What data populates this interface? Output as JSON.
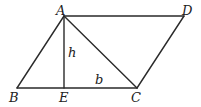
{
  "diagram": {
    "type": "geometry-parallelogram",
    "colors": {
      "line": "#2a2a2a",
      "label": "#222222",
      "background": "#ffffff"
    },
    "points": {
      "A": {
        "label": "A",
        "x": 64,
        "y": 16
      },
      "D": {
        "label": "D",
        "x": 184,
        "y": 16
      },
      "B": {
        "label": "B",
        "x": 17,
        "y": 88
      },
      "E": {
        "label": "E",
        "x": 64,
        "y": 88
      },
      "C": {
        "label": "C",
        "x": 137,
        "y": 88
      }
    },
    "segments": [
      {
        "name": "AD",
        "from": "A",
        "to": "D"
      },
      {
        "name": "AB",
        "from": "A",
        "to": "B"
      },
      {
        "name": "BC",
        "from": "B",
        "to": "C"
      },
      {
        "name": "CD",
        "from": "C",
        "to": "D"
      },
      {
        "name": "AC",
        "from": "A",
        "to": "C"
      },
      {
        "name": "AE",
        "from": "A",
        "to": "E"
      }
    ],
    "annotations": {
      "height": "h",
      "base": "b"
    }
  }
}
